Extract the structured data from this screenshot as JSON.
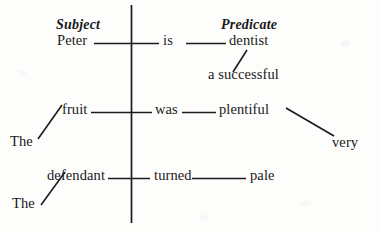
{
  "diagram": {
    "type": "reed-kellogg-sentence-diagram",
    "ink_color": "#1c1c1c",
    "paper_color": "#fdfdfc",
    "headers": {
      "subject_label": "Subject",
      "predicate_label": "Predicate"
    },
    "sentences": [
      {
        "id": "sentence-1",
        "subject": "Peter",
        "verb": "is",
        "complement": "dentist",
        "modifiers": [
          {
            "text": "a successful",
            "attaches_to": "dentist",
            "slant": "up-right"
          }
        ]
      },
      {
        "id": "sentence-2",
        "subject": "fruit",
        "verb": "was",
        "complement": "plentiful",
        "modifiers": [
          {
            "text": "The",
            "attaches_to": "fruit",
            "slant": "down-left"
          },
          {
            "text": "very",
            "attaches_to": "plentiful",
            "slant": "down-right"
          }
        ]
      },
      {
        "id": "sentence-3",
        "subject": "defendant",
        "verb": "turned",
        "complement": "pale",
        "modifiers": [
          {
            "text": "The",
            "attaches_to": "defendant",
            "slant": "down-left"
          }
        ]
      }
    ]
  }
}
